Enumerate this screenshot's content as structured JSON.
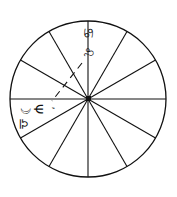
{
  "chart": {
    "type": "astrological-wheel",
    "houses": 12,
    "center": {
      "x": 88,
      "y": 98
    },
    "radius": 78,
    "line_color": "#111111",
    "background": "#ffffff"
  },
  "labels": {
    "top_sign_1": "♋",
    "top_sign_2": "♌",
    "left_moon": "☽",
    "left_neptune": "Ψ",
    "left_mark": "ʼ",
    "left_sign": "♎"
  }
}
